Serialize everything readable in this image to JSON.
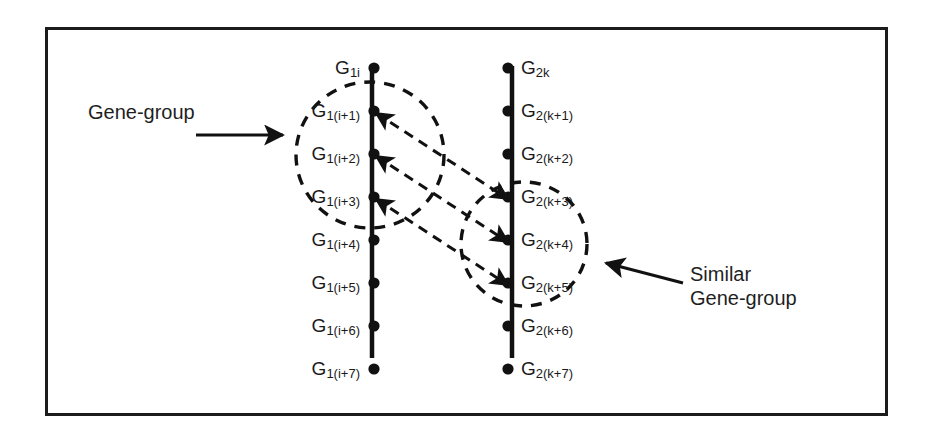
{
  "figure": {
    "background_color": "#ffffff",
    "border_color": "#1c1c1c",
    "ink_color": "#111111"
  },
  "columns": [
    {
      "id": "genome-1",
      "side": "left",
      "axis_x": 372,
      "axis_top": 66,
      "axis_bottom": 358,
      "label_align": "right",
      "nodes": [
        {
          "base": "G",
          "sub": "1i",
          "y": 68,
          "label": "G1i"
        },
        {
          "base": "G",
          "sub": "1(i+1)",
          "y": 111,
          "label": "G1(i+1)"
        },
        {
          "base": "G",
          "sub": "1(i+2)",
          "y": 154,
          "label": "G1(i+2)"
        },
        {
          "base": "G",
          "sub": "1(i+3)",
          "y": 197,
          "label": "G1(i+3)"
        },
        {
          "base": "G",
          "sub": "1(i+4)",
          "y": 240,
          "label": "G1(i+4)"
        },
        {
          "base": "G",
          "sub": "1(i+5)",
          "y": 283,
          "label": "G1(i+5)"
        },
        {
          "base": "G",
          "sub": "1(i+6)",
          "y": 326,
          "label": "G1(i+6)"
        },
        {
          "base": "G",
          "sub": "1(i+7)",
          "y": 369,
          "label": "G1(i+7)"
        }
      ]
    },
    {
      "id": "genome-2",
      "side": "right",
      "axis_x": 512,
      "axis_top": 66,
      "axis_bottom": 358,
      "label_align": "left",
      "nodes": [
        {
          "base": "G",
          "sub": "2k",
          "y": 68,
          "label": "G2k"
        },
        {
          "base": "G",
          "sub": "2(k+1)",
          "y": 111,
          "label": "G2(k+1)"
        },
        {
          "base": "G",
          "sub": "2(k+2)",
          "y": 154,
          "label": "G2(k+2)"
        },
        {
          "base": "G",
          "sub": "2(k+3)",
          "y": 197,
          "label": "G2(k+3)"
        },
        {
          "base": "G",
          "sub": "2(k+4)",
          "y": 240,
          "label": "G2(k+4)"
        },
        {
          "base": "G",
          "sub": "2(k+5)",
          "y": 283,
          "label": "G2(k+5)"
        },
        {
          "base": "G",
          "sub": "2(k+6)",
          "y": 326,
          "label": "G2(k+6)"
        },
        {
          "base": "G",
          "sub": "2(k+7)",
          "y": 369,
          "label": "G2(k+7)"
        }
      ]
    }
  ],
  "groups": [
    {
      "id": "gene-group",
      "cx": 370,
      "cy": 155,
      "rx": 74,
      "ry": 73,
      "style": "dashed",
      "members": [
        "G1(i+1)",
        "G1(i+2)",
        "G1(i+3)"
      ]
    },
    {
      "id": "similar-gene-group",
      "cx": 524,
      "cy": 244,
      "rx": 63,
      "ry": 62,
      "style": "dashed",
      "members": [
        "G2(k+3)",
        "G2(k+4)",
        "G2(k+5)"
      ]
    }
  ],
  "correspondences": [
    {
      "from": "G1(i+1)",
      "to": "G2(k+3)",
      "x1": 376,
      "y1": 113,
      "x2": 508,
      "y2": 199,
      "style": "dashed",
      "arrows": "both"
    },
    {
      "from": "G1(i+2)",
      "to": "G2(k+4)",
      "x1": 376,
      "y1": 156,
      "x2": 508,
      "y2": 242,
      "style": "dashed",
      "arrows": "both"
    },
    {
      "from": "G1(i+3)",
      "to": "G2(k+5)",
      "x1": 376,
      "y1": 199,
      "x2": 508,
      "y2": 285,
      "style": "dashed",
      "arrows": "both"
    }
  ],
  "annotations": [
    {
      "id": "gene-group-callout",
      "lines": [
        "Gene-group"
      ],
      "text_x": 88,
      "text_y": 100,
      "leader": {
        "x1": 196,
        "y1": 135,
        "x2": 283,
        "y2": 135,
        "arrow_at": "end"
      }
    },
    {
      "id": "similar-gene-group-callout",
      "lines": [
        "Similar",
        "Gene-group"
      ],
      "text_x": 690,
      "text_y": 262,
      "leader": {
        "x1": 683,
        "y1": 283,
        "x2": 606,
        "y2": 263,
        "arrow_at": "end"
      }
    }
  ]
}
